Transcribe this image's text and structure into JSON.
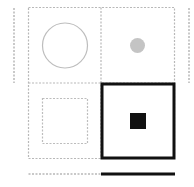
{
  "diagram": {
    "title": "",
    "colors": {
      "dashed": "#b8b8b8",
      "thick": "#111111",
      "gray_dot": "#c4c4c4",
      "black_square": "#111111"
    },
    "cells": [
      {
        "row": 0,
        "col": 0,
        "shape": "circle-outline",
        "selected": false
      },
      {
        "row": 0,
        "col": 1,
        "shape": "small-gray-dot",
        "selected": false
      },
      {
        "row": 1,
        "col": 0,
        "shape": "dashed-square-outline",
        "selected": false
      },
      {
        "row": 1,
        "col": 1,
        "shape": "small-black-square",
        "selected": true
      }
    ],
    "side_markers": [
      "left-dashed-bar",
      "right-dashed-bar"
    ],
    "bottom_bar": {
      "dashed_segment": "left",
      "solid_segment": "right"
    }
  }
}
